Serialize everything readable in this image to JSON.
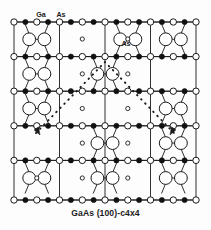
{
  "figure": {
    "caption": "GaAs (100)-c4x4",
    "labels": [
      {
        "id": "ga-label",
        "text": "Ga",
        "x": 41,
        "y": 15
      },
      {
        "id": "as-label-top",
        "text": "As",
        "x": 61,
        "y": 15
      },
      {
        "id": "as-label-mid",
        "text": "As",
        "x": 126,
        "y": 44
      }
    ],
    "colors": {
      "line": "#1a1a1a",
      "ga_fill": "#111111",
      "as_fill": "#ffffff",
      "stroke": "#1a1a1a",
      "background": "#fdfdfd",
      "text": "#1a1a1a"
    },
    "legend": {
      "ga_symbol": "filled-circle",
      "as_symbol": "open-circle",
      "as_dimer_symbol": "large-open-circle",
      "subsurface_symbol": "small-open-circle"
    },
    "frame": {
      "x": 14,
      "y": 22,
      "w": 182,
      "h": 178
    },
    "grid": {
      "columns": [
        14,
        59.5,
        105,
        150.5,
        196
      ],
      "rows": [
        22,
        56.6,
        91.2,
        125.8,
        160.4,
        200
      ],
      "row_lines": [
        22,
        56.6,
        91.2,
        125.8,
        200
      ],
      "note": "4x4 surface unit mesh lines"
    },
    "chart_data": {
      "type": "scatter",
      "title": "GaAs (100)-c4x4",
      "xlabel": "",
      "ylabel": "",
      "legend_entries": [
        "Ga",
        "As"
      ],
      "annotations": [
        "Ga",
        "As",
        "As"
      ],
      "description": "Top view ball-and-stick model of the GaAs (100)-c(4x4) reconstructed surface showing As dimers, Ga and As lattice atoms, the c(4x4) unit mesh outlined by dotted lines with arrows.",
      "atom_rows": [
        {
          "row": 0,
          "y": 22,
          "kind": "lattice-row",
          "atoms": [
            {
              "x": 14,
              "t": "as"
            },
            {
              "x": 25.4,
              "t": "ga"
            },
            {
              "x": 36.8,
              "t": "as"
            },
            {
              "x": 48.1,
              "t": "ga"
            },
            {
              "x": 59.5,
              "t": "as"
            },
            {
              "x": 70.9,
              "t": "ga"
            },
            {
              "x": 82.3,
              "t": "as"
            },
            {
              "x": 93.6,
              "t": "ga"
            },
            {
              "x": 105,
              "t": "as"
            },
            {
              "x": 116.4,
              "t": "ga"
            },
            {
              "x": 127.8,
              "t": "as"
            },
            {
              "x": 139.1,
              "t": "ga"
            },
            {
              "x": 150.5,
              "t": "as"
            },
            {
              "x": 161.9,
              "t": "ga"
            },
            {
              "x": 173.3,
              "t": "as"
            },
            {
              "x": 184.6,
              "t": "ga"
            },
            {
              "x": 196,
              "t": "as"
            }
          ]
        },
        {
          "row": 1,
          "y": 56.6,
          "kind": "lattice-row",
          "atoms": [
            {
              "x": 14,
              "t": "as"
            },
            {
              "x": 25.4,
              "t": "ga"
            },
            {
              "x": 36.8,
              "t": "as"
            },
            {
              "x": 48.1,
              "t": "ga"
            },
            {
              "x": 59.5,
              "t": "as"
            },
            {
              "x": 70.9,
              "t": "ga"
            },
            {
              "x": 82.3,
              "t": "as"
            },
            {
              "x": 93.6,
              "t": "ga"
            },
            {
              "x": 105,
              "t": "as"
            },
            {
              "x": 116.4,
              "t": "ga"
            },
            {
              "x": 127.8,
              "t": "as"
            },
            {
              "x": 139.1,
              "t": "ga"
            },
            {
              "x": 150.5,
              "t": "as"
            },
            {
              "x": 161.9,
              "t": "ga"
            },
            {
              "x": 173.3,
              "t": "as"
            },
            {
              "x": 184.6,
              "t": "ga"
            },
            {
              "x": 196,
              "t": "as"
            }
          ]
        },
        {
          "row": 2,
          "y": 91.2,
          "kind": "lattice-row",
          "atoms": [
            {
              "x": 14,
              "t": "as"
            },
            {
              "x": 25.4,
              "t": "ga"
            },
            {
              "x": 36.8,
              "t": "as"
            },
            {
              "x": 48.1,
              "t": "ga"
            },
            {
              "x": 59.5,
              "t": "as"
            },
            {
              "x": 70.9,
              "t": "ga"
            },
            {
              "x": 82.3,
              "t": "as"
            },
            {
              "x": 93.6,
              "t": "ga"
            },
            {
              "x": 105,
              "t": "as"
            },
            {
              "x": 116.4,
              "t": "ga"
            },
            {
              "x": 127.8,
              "t": "as"
            },
            {
              "x": 139.1,
              "t": "ga"
            },
            {
              "x": 150.5,
              "t": "as"
            },
            {
              "x": 161.9,
              "t": "ga"
            },
            {
              "x": 173.3,
              "t": "as"
            },
            {
              "x": 184.6,
              "t": "ga"
            },
            {
              "x": 196,
              "t": "as"
            }
          ]
        },
        {
          "row": 3,
          "y": 125.8,
          "kind": "lattice-row",
          "atoms": [
            {
              "x": 14,
              "t": "as"
            },
            {
              "x": 25.4,
              "t": "ga"
            },
            {
              "x": 36.8,
              "t": "as"
            },
            {
              "x": 48.1,
              "t": "ga"
            },
            {
              "x": 59.5,
              "t": "as"
            },
            {
              "x": 70.9,
              "t": "ga"
            },
            {
              "x": 82.3,
              "t": "as"
            },
            {
              "x": 93.6,
              "t": "ga"
            },
            {
              "x": 105,
              "t": "as"
            },
            {
              "x": 116.4,
              "t": "ga"
            },
            {
              "x": 127.8,
              "t": "as"
            },
            {
              "x": 139.1,
              "t": "ga"
            },
            {
              "x": 150.5,
              "t": "as"
            },
            {
              "x": 161.9,
              "t": "ga"
            },
            {
              "x": 173.3,
              "t": "as"
            },
            {
              "x": 184.6,
              "t": "ga"
            },
            {
              "x": 196,
              "t": "as"
            }
          ]
        },
        {
          "row": 4,
          "y": 160.4,
          "kind": "lattice-row",
          "atoms": [
            {
              "x": 14,
              "t": "as"
            },
            {
              "x": 25.4,
              "t": "ga"
            },
            {
              "x": 36.8,
              "t": "as"
            },
            {
              "x": 48.1,
              "t": "ga"
            },
            {
              "x": 59.5,
              "t": "as"
            },
            {
              "x": 70.9,
              "t": "ga"
            },
            {
              "x": 82.3,
              "t": "as"
            },
            {
              "x": 93.6,
              "t": "ga"
            },
            {
              "x": 105,
              "t": "as"
            },
            {
              "x": 116.4,
              "t": "ga"
            },
            {
              "x": 127.8,
              "t": "as"
            },
            {
              "x": 139.1,
              "t": "ga"
            },
            {
              "x": 150.5,
              "t": "as"
            },
            {
              "x": 161.9,
              "t": "ga"
            },
            {
              "x": 173.3,
              "t": "as"
            },
            {
              "x": 184.6,
              "t": "ga"
            },
            {
              "x": 196,
              "t": "as"
            }
          ]
        },
        {
          "row": 5,
          "y": 200,
          "kind": "lattice-row",
          "atoms": [
            {
              "x": 14,
              "t": "as"
            },
            {
              "x": 25.4,
              "t": "ga"
            },
            {
              "x": 36.8,
              "t": "as"
            },
            {
              "x": 48.1,
              "t": "ga"
            },
            {
              "x": 59.5,
              "t": "as"
            },
            {
              "x": 70.9,
              "t": "ga"
            },
            {
              "x": 82.3,
              "t": "as"
            },
            {
              "x": 93.6,
              "t": "ga"
            },
            {
              "x": 105,
              "t": "as"
            },
            {
              "x": 116.4,
              "t": "ga"
            },
            {
              "x": 127.8,
              "t": "as"
            },
            {
              "x": 139.1,
              "t": "ga"
            },
            {
              "x": 150.5,
              "t": "as"
            },
            {
              "x": 161.9,
              "t": "ga"
            },
            {
              "x": 173.3,
              "t": "as"
            },
            {
              "x": 184.6,
              "t": "ga"
            },
            {
              "x": 196,
              "t": "as"
            }
          ]
        }
      ],
      "small_circles": [
        {
          "x": 82.3,
          "y": 39
        },
        {
          "x": 82.3,
          "y": 73.9
        },
        {
          "x": 82.3,
          "y": 108.5
        },
        {
          "x": 82.3,
          "y": 143.1
        },
        {
          "x": 82.3,
          "y": 178
        },
        {
          "x": 127.8,
          "y": 39
        },
        {
          "x": 127.8,
          "y": 73.9
        },
        {
          "x": 127.8,
          "y": 108.5
        },
        {
          "x": 127.8,
          "y": 143.1
        },
        {
          "x": 127.8,
          "y": 178
        },
        {
          "x": 36.8,
          "y": 178
        }
      ],
      "dimer_blocks": [
        {
          "cx": 36.8,
          "cy": 39.3,
          "cell": [
            0,
            0
          ]
        },
        {
          "cx": 36.8,
          "cy": 73.9,
          "cell": [
            0,
            1
          ]
        },
        {
          "cx": 36.8,
          "cy": 108.5,
          "cell": [
            0,
            2
          ]
        },
        {
          "cx": 127.8,
          "cy": 39.3,
          "cell": [
            2,
            0
          ]
        },
        {
          "cx": 105,
          "cy": 73.9,
          "cell": [
            1,
            1
          ]
        },
        {
          "cx": 105,
          "cy": 143.1,
          "cell": [
            1,
            3
          ]
        },
        {
          "cx": 173.3,
          "cy": 39.3,
          "cell": [
            3,
            0
          ]
        },
        {
          "cx": 173.3,
          "cy": 108.5,
          "cell": [
            3,
            2
          ]
        },
        {
          "cx": 173.3,
          "cy": 143.1,
          "cell": [
            3,
            3
          ]
        },
        {
          "cx": 36.8,
          "cy": 178,
          "cell": [
            0,
            4
          ]
        },
        {
          "cx": 105,
          "cy": 178,
          "cell": [
            1,
            4
          ]
        },
        {
          "cx": 173.3,
          "cy": 178,
          "cell": [
            3,
            4
          ]
        }
      ],
      "unit_mesh": {
        "style": "dotted",
        "path": "M 36 133 L 105 62 L 174 133",
        "arrow_left": {
          "x": 38,
          "y": 131,
          "dir": "down-left"
        },
        "arrow_right": {
          "x": 172,
          "y": 131,
          "dir": "down-right"
        }
      }
    }
  }
}
